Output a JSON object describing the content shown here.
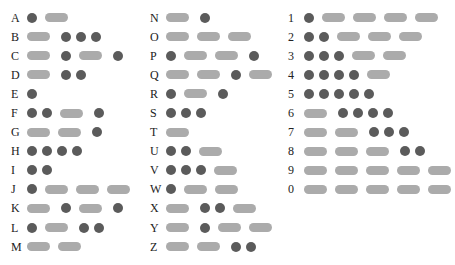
{
  "colors": {
    "dot": "#5b5b5b",
    "dash": "#ababab",
    "text": "#222222"
  },
  "columns": [
    {
      "rows": [
        {
          "label": "A",
          "code": ".-"
        },
        {
          "label": "B",
          "code": "-..."
        },
        {
          "label": "C",
          "code": "-.-."
        },
        {
          "label": "D",
          "code": "-.."
        },
        {
          "label": "E",
          "code": "."
        },
        {
          "label": "F",
          "code": "..-."
        },
        {
          "label": "G",
          "code": "--."
        },
        {
          "label": "H",
          "code": "...."
        },
        {
          "label": "I",
          "code": ".."
        },
        {
          "label": "J",
          "code": ".---"
        },
        {
          "label": "K",
          "code": "-.-."
        },
        {
          "label": "L",
          "code": ".-.."
        },
        {
          "label": "M",
          "code": "--"
        }
      ]
    },
    {
      "rows": [
        {
          "label": "N",
          "code": "-."
        },
        {
          "label": "O",
          "code": "---"
        },
        {
          "label": "P",
          "code": ".--."
        },
        {
          "label": "Q",
          "code": "--.-"
        },
        {
          "label": "R",
          "code": ".-."
        },
        {
          "label": "S",
          "code": "..."
        },
        {
          "label": "T",
          "code": "-"
        },
        {
          "label": "U",
          "code": "..-"
        },
        {
          "label": "V",
          "code": "...-"
        },
        {
          "label": "W",
          "code": ".--"
        },
        {
          "label": "X",
          "code": "-..-"
        },
        {
          "label": "Y",
          "code": "-.--"
        },
        {
          "label": "Z",
          "code": "--.."
        }
      ]
    },
    {
      "rows": [
        {
          "label": "1",
          "code": ".----"
        },
        {
          "label": "2",
          "code": "..---"
        },
        {
          "label": "3",
          "code": "...--"
        },
        {
          "label": "4",
          "code": "....-"
        },
        {
          "label": "5",
          "code": "....."
        },
        {
          "label": "6",
          "code": "-...."
        },
        {
          "label": "7",
          "code": "--..."
        },
        {
          "label": "8",
          "code": "---.."
        },
        {
          "label": "9",
          "code": "-----"
        },
        {
          "label": "0",
          "code": "-----"
        }
      ]
    }
  ]
}
